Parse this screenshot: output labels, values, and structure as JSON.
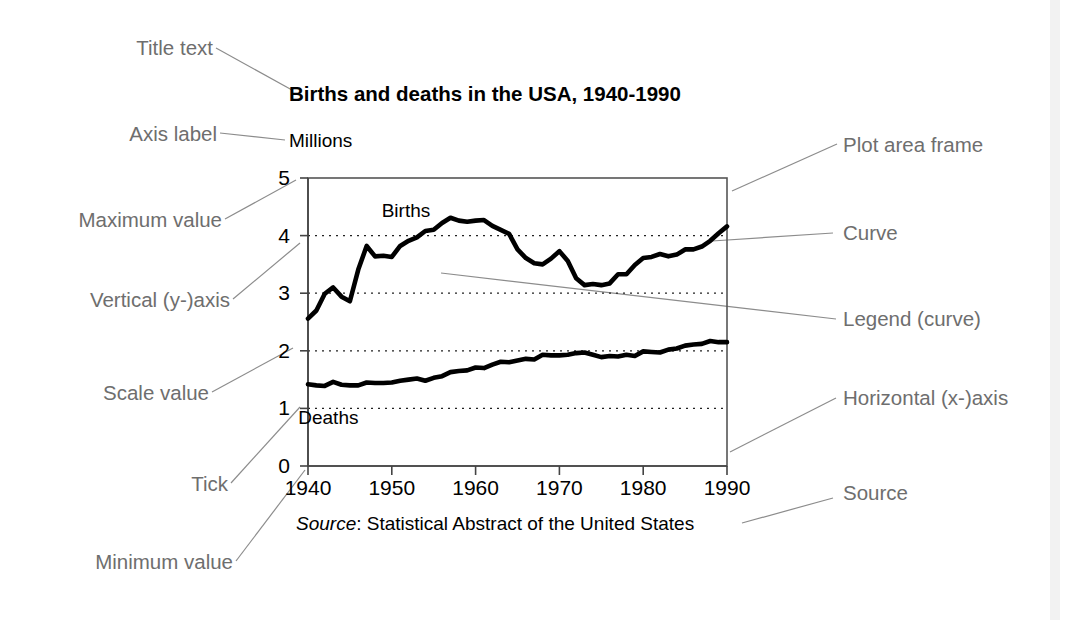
{
  "figure": {
    "kind": "annotated-chart-diagram",
    "background": "#ffffff",
    "annotation_color": "#6e6e6e",
    "ink_color": "#000000"
  },
  "annotations": {
    "left": [
      {
        "id": "title-text",
        "label": "Title text"
      },
      {
        "id": "axis-label",
        "label": "Axis label"
      },
      {
        "id": "maximum-value",
        "label": "Maximum value"
      },
      {
        "id": "vertical-y-axis",
        "label": "Vertical (y-)axis"
      },
      {
        "id": "scale-value",
        "label": "Scale value"
      },
      {
        "id": "tick",
        "label": "Tick"
      },
      {
        "id": "minimum-value",
        "label": "Minimum value"
      }
    ],
    "right": [
      {
        "id": "plot-area-frame",
        "label": "Plot area frame"
      },
      {
        "id": "curve",
        "label": "Curve"
      },
      {
        "id": "legend-curve",
        "label": "Legend (curve)"
      },
      {
        "id": "horizontal-x-axis",
        "label": "Horizontal (x-)axis"
      },
      {
        "id": "source",
        "label": "Source"
      }
    ]
  },
  "chart_data": {
    "type": "line",
    "title": "Births and deaths in the USA, 1940-1990",
    "ylabel": "Millions",
    "xlabel": "",
    "source_prefix": "Source",
    "source_separator": ": ",
    "source_text": "Statistical Abstract of the United States",
    "xlim": [
      1940,
      1990
    ],
    "ylim": [
      0,
      5
    ],
    "xticks": [
      1940,
      1950,
      1960,
      1970,
      1980,
      1990
    ],
    "yticks": [
      0,
      1,
      2,
      3,
      4,
      5
    ],
    "grid": "horizontal-dotted-at-1-2-3-4",
    "legend_position": "inline-on-curve",
    "series": [
      {
        "name": "Births",
        "label_x": 1955,
        "x": [
          1940,
          1941,
          1942,
          1943,
          1944,
          1945,
          1946,
          1947,
          1948,
          1949,
          1950,
          1951,
          1952,
          1953,
          1954,
          1955,
          1956,
          1957,
          1958,
          1959,
          1960,
          1961,
          1962,
          1963,
          1964,
          1965,
          1966,
          1967,
          1968,
          1969,
          1970,
          1971,
          1972,
          1973,
          1974,
          1975,
          1976,
          1977,
          1978,
          1979,
          1980,
          1981,
          1982,
          1983,
          1984,
          1985,
          1986,
          1987,
          1988,
          1989,
          1990
        ],
        "values": [
          2.56,
          2.7,
          2.99,
          3.1,
          2.94,
          2.86,
          3.41,
          3.82,
          3.64,
          3.65,
          3.63,
          3.82,
          3.91,
          3.97,
          4.08,
          4.1,
          4.22,
          4.31,
          4.26,
          4.24,
          4.26,
          4.27,
          4.17,
          4.1,
          4.03,
          3.76,
          3.61,
          3.52,
          3.5,
          3.6,
          3.73,
          3.56,
          3.26,
          3.14,
          3.16,
          3.14,
          3.17,
          3.33,
          3.33,
          3.49,
          3.61,
          3.63,
          3.68,
          3.64,
          3.67,
          3.76,
          3.76,
          3.81,
          3.91,
          4.04,
          4.16
        ]
      },
      {
        "name": "Deaths",
        "label_x": 1946,
        "x": [
          1940,
          1941,
          1942,
          1943,
          1944,
          1945,
          1946,
          1947,
          1948,
          1949,
          1950,
          1951,
          1952,
          1953,
          1954,
          1955,
          1956,
          1957,
          1958,
          1959,
          1960,
          1961,
          1962,
          1963,
          1964,
          1965,
          1966,
          1967,
          1968,
          1969,
          1970,
          1971,
          1972,
          1973,
          1974,
          1975,
          1976,
          1977,
          1978,
          1979,
          1980,
          1981,
          1982,
          1983,
          1984,
          1985,
          1986,
          1987,
          1988,
          1989,
          1990
        ],
        "values": [
          1.42,
          1.4,
          1.39,
          1.46,
          1.41,
          1.4,
          1.4,
          1.45,
          1.44,
          1.44,
          1.45,
          1.48,
          1.5,
          1.52,
          1.48,
          1.53,
          1.56,
          1.63,
          1.65,
          1.66,
          1.71,
          1.7,
          1.76,
          1.81,
          1.8,
          1.83,
          1.86,
          1.85,
          1.93,
          1.92,
          1.92,
          1.93,
          1.96,
          1.97,
          1.93,
          1.89,
          1.91,
          1.9,
          1.93,
          1.91,
          1.99,
          1.98,
          1.97,
          2.02,
          2.04,
          2.09,
          2.11,
          2.12,
          2.17,
          2.15,
          2.15
        ]
      }
    ]
  }
}
